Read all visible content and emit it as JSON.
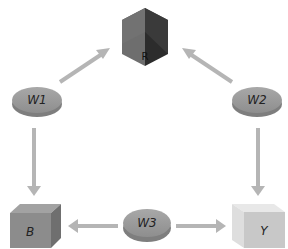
{
  "diagram": {
    "type": "graph",
    "nodes": [
      {
        "id": "R",
        "label": "R",
        "shape": "cube",
        "color": "#3a3a3a",
        "x": 145,
        "y": 35
      },
      {
        "id": "W1",
        "label": "W1",
        "shape": "disc",
        "color": "#9a9a9a",
        "x": 37,
        "y": 100
      },
      {
        "id": "W2",
        "label": "W2",
        "shape": "disc",
        "color": "#9a9a9a",
        "x": 257,
        "y": 100
      },
      {
        "id": "W3",
        "label": "W3",
        "shape": "disc",
        "color": "#9a9a9a",
        "x": 147,
        "y": 222
      },
      {
        "id": "B",
        "label": "B",
        "shape": "cube",
        "color": "#8c8c8c",
        "x": 35,
        "y": 228
      },
      {
        "id": "Y",
        "label": "Y",
        "shape": "cube",
        "color": "#d2d2d2",
        "x": 258,
        "y": 228
      }
    ],
    "edges": [
      {
        "from": "W1",
        "to": "R"
      },
      {
        "from": "W2",
        "to": "R"
      },
      {
        "from": "W1",
        "to": "B"
      },
      {
        "from": "W2",
        "to": "Y"
      },
      {
        "from": "W3",
        "to": "B"
      },
      {
        "from": "W3",
        "to": "Y"
      }
    ],
    "arrow_color": "#b8b8b8"
  },
  "labels": {
    "r": "R",
    "w1": "W1",
    "w2": "W2",
    "w3": "W3",
    "b": "B",
    "y": "Y"
  }
}
